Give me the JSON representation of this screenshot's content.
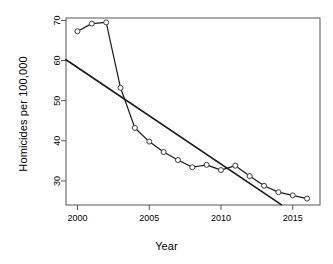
{
  "chart_data": {
    "type": "line",
    "title": "",
    "xlabel": "Year",
    "ylabel": "Homicides per 100,000",
    "xlim": [
      1999.2,
      2016.9
    ],
    "ylim": [
      24.0,
      70.6
    ],
    "xticks": [
      2000,
      2005,
      2010,
      2015
    ],
    "xtick_labels": [
      "2000",
      "2005",
      "2010",
      "2015"
    ],
    "yticks": [
      30,
      40,
      50,
      60,
      70
    ],
    "ytick_labels": [
      "30",
      "40",
      "50",
      "60",
      "70"
    ],
    "grid": false,
    "legend": null,
    "x": [
      2000,
      2001,
      2002,
      2003,
      2004,
      2005,
      2006,
      2007,
      2008,
      2009,
      2010,
      2011,
      2012,
      2013,
      2014,
      2015,
      2016
    ],
    "series": [
      {
        "name": "Homicide rate",
        "marker": "open-circle",
        "values": [
          67.3,
          69.2,
          69.5,
          53.2,
          43.2,
          39.8,
          37.2,
          35.2,
          33.4,
          34.0,
          32.7,
          33.8,
          31.2,
          28.8,
          27.2,
          26.4,
          25.6
        ]
      },
      {
        "name": "Linear trend",
        "marker": "none",
        "type": "trendline",
        "endpoints": [
          {
            "x": 1999.2,
            "y": 60.2
          },
          {
            "x": 2014.2,
            "y": 24.1
          }
        ]
      }
    ],
    "axis_color": "#555555",
    "line_color": "#1a1a1a",
    "marker_face": "#ffffff",
    "marker_edge": "#3a3a3a"
  }
}
